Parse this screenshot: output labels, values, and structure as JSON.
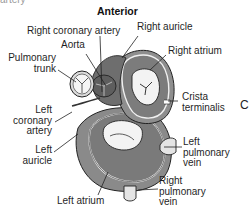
{
  "figure": {
    "clipped_text_top": "artery",
    "orientation_label": "Anterior",
    "panel_letter": "C"
  },
  "labels": {
    "right_coronary_artery": "Right coronary artery",
    "aorta": "Aorta",
    "pulmonary_trunk_line1": "Pulmonary",
    "pulmonary_trunk_line2": "trunk",
    "right_auricle": "Right auricle",
    "right_atrium": "Right atrium",
    "crista_line1": "Crista",
    "crista_line2": "terminalis",
    "left_coronary_line1": "Left",
    "left_coronary_line2": "coronary",
    "left_coronary_line3": "artery",
    "left_auricle_line1": "Left",
    "left_auricle_line2": "auricle",
    "left_pulm_line1": "Left",
    "left_pulm_line2": "pulmonary",
    "left_pulm_line3": "vein",
    "right_pulm_line1": "Right",
    "right_pulm_line2": "pulmonary",
    "right_pulm_line3": "vein",
    "left_atrium": "Left atrium"
  },
  "colors": {
    "heart_dark": "#6e6e6e",
    "heart_mid": "#9a9a9a",
    "heart_light": "#c4c4c4",
    "chamber_inner": "#f2f2f2",
    "outline": "#222222"
  }
}
